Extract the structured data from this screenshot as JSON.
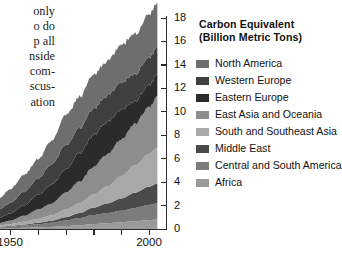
{
  "page_text": {
    "lines": [
      "only",
      "o do",
      "p all",
      "nside",
      "com-",
      "scus-",
      "ation"
    ]
  },
  "legend": {
    "title_line1": "Carbon Equivalent",
    "title_line2": "(Billion Metric Tons)",
    "items": [
      {
        "label": "North America",
        "color": "#6e6e6e"
      },
      {
        "label": "Western Europe",
        "color": "#3f3f3f"
      },
      {
        "label": "Eastern Europe",
        "color": "#2b2b2b"
      },
      {
        "label": "East Asia and Oceania",
        "color": "#8d8d8d"
      },
      {
        "label": "South and Southeast Asia",
        "color": "#a8a8a8"
      },
      {
        "label": "Middle East",
        "color": "#4a4a4a"
      },
      {
        "label": "Central and South America",
        "color": "#7c7c7c"
      },
      {
        "label": "Africa",
        "color": "#9a9a9a"
      }
    ]
  },
  "chart_data": {
    "type": "area",
    "stacked": true,
    "title": "Carbon Equivalent (Billion Metric Tons)",
    "xlabel": "",
    "ylabel": "Carbon Equivalent (Billion Metric Tons)",
    "ylim": [
      0,
      18
    ],
    "yticks": [
      0,
      2,
      4,
      6,
      8,
      10,
      12,
      14,
      16,
      18
    ],
    "xlim": [
      1946,
      2003
    ],
    "xticks": [
      1950,
      1960,
      1970,
      1980,
      1990,
      2000
    ],
    "xticklabels": [
      "1950",
      "",
      "",
      "",
      "",
      "2000"
    ],
    "grid": false,
    "legend_position": "right",
    "x": [
      1946,
      1950,
      1955,
      1960,
      1965,
      1970,
      1975,
      1980,
      1985,
      1990,
      1995,
      2000,
      2003
    ],
    "series": [
      {
        "name": "Africa",
        "color": "#9a9a9a",
        "values": [
          0.05,
          0.07,
          0.1,
          0.14,
          0.18,
          0.25,
          0.32,
          0.42,
          0.5,
          0.58,
          0.66,
          0.76,
          0.82
        ]
      },
      {
        "name": "Central and South America",
        "color": "#7c7c7c",
        "values": [
          0.1,
          0.14,
          0.2,
          0.27,
          0.35,
          0.48,
          0.62,
          0.78,
          0.86,
          0.98,
          1.14,
          1.3,
          1.38
        ]
      },
      {
        "name": "Middle East",
        "color": "#4a4a4a",
        "values": [
          0.03,
          0.05,
          0.08,
          0.12,
          0.18,
          0.28,
          0.42,
          0.62,
          0.82,
          1.05,
          1.3,
          1.55,
          1.68
        ]
      },
      {
        "name": "South and Southeast Asia",
        "color": "#a8a8a8",
        "values": [
          0.12,
          0.16,
          0.24,
          0.34,
          0.46,
          0.64,
          0.84,
          1.12,
          1.46,
          1.9,
          2.34,
          2.8,
          3.05
        ]
      },
      {
        "name": "East Asia and Oceania",
        "color": "#8d8d8d",
        "values": [
          0.2,
          0.3,
          0.5,
          0.8,
          1.0,
          1.45,
          1.85,
          2.35,
          2.75,
          3.15,
          3.55,
          4.0,
          4.35
        ]
      },
      {
        "name": "Eastern Europe",
        "color": "#2b2b2b",
        "values": [
          0.45,
          0.6,
          0.9,
          1.25,
          1.6,
          2.0,
          2.4,
          2.7,
          2.8,
          2.55,
          1.95,
          1.85,
          1.9
        ]
      },
      {
        "name": "Western Europe",
        "color": "#3f3f3f",
        "values": [
          0.7,
          0.9,
          1.15,
          1.4,
          1.7,
          2.05,
          2.15,
          2.3,
          2.25,
          2.3,
          2.3,
          2.35,
          2.38
        ]
      },
      {
        "name": "North America",
        "color": "#6e6e6e",
        "values": [
          0.95,
          1.15,
          1.45,
          1.65,
          2.0,
          2.55,
          2.65,
          2.9,
          2.95,
          3.2,
          3.4,
          3.65,
          3.75
        ]
      }
    ],
    "total_top_values": [
      2.6,
      3.37,
      4.62,
      5.97,
      7.47,
      9.7,
      11.25,
      13.19,
      14.39,
      15.71,
      16.64,
      18.26,
      19.31
    ]
  }
}
